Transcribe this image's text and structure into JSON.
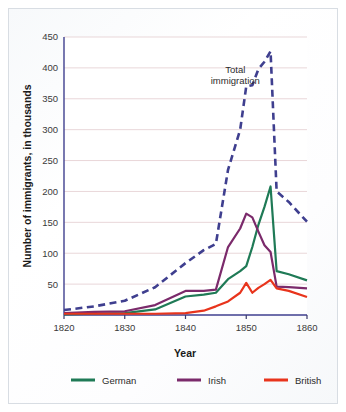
{
  "chart_data": {
    "type": "line",
    "title": "",
    "xlabel": "Year",
    "ylabel": "Number of immigrants, in thousands",
    "xlim": [
      1820,
      1860
    ],
    "ylim": [
      0,
      450
    ],
    "xticks": [
      1820,
      1830,
      1840,
      1850,
      1860
    ],
    "xtick_labels": [
      "1820",
      "1830",
      "1840",
      "1850",
      "1860"
    ],
    "yticks": [
      50,
      100,
      150,
      200,
      250,
      300,
      350,
      400,
      450
    ],
    "ytick_labels": [
      "50",
      "100",
      "150",
      "200",
      "250",
      "300",
      "350",
      "400",
      "450"
    ],
    "grid": "horizontal",
    "legend_position": "below",
    "annotations": [
      {
        "name": "total-immigration-label",
        "line1": "Total",
        "line2": "immigration",
        "x": 1848.2,
        "y": 392
      }
    ],
    "x": [
      1820,
      1825,
      1830,
      1835,
      1840,
      1843,
      1845,
      1847,
      1849,
      1850,
      1851,
      1852,
      1853,
      1854,
      1855,
      1857,
      1860
    ],
    "series": [
      {
        "name": "Total immigration",
        "key": "total",
        "color": "#3f3f8f",
        "style": "dashed",
        "in_legend": false,
        "values": [
          8,
          14,
          23,
          45,
          84,
          105,
          115,
          235,
          300,
          370,
          372,
          398,
          410,
          427,
          200,
          183,
          151
        ]
      },
      {
        "name": "German",
        "key": "german",
        "color": "#1f7a56",
        "style": "solid",
        "in_legend": true,
        "values": [
          1,
          2,
          3,
          9,
          30,
          33,
          36,
          58,
          71,
          79,
          110,
          146,
          175,
          208,
          71,
          66,
          56
        ]
      },
      {
        "name": "Irish",
        "key": "irish",
        "color": "#7b2a6b",
        "style": "solid",
        "in_legend": true,
        "values": [
          3,
          5,
          6,
          16,
          39,
          39,
          41,
          110,
          140,
          164,
          158,
          135,
          113,
          102,
          46,
          45,
          43
        ]
      },
      {
        "name": "British",
        "key": "british",
        "color": "#e8341c",
        "style": "solid",
        "in_legend": true,
        "values": [
          2,
          2,
          2,
          2,
          3,
          7,
          14,
          22,
          36,
          52,
          36,
          44,
          50,
          57,
          43,
          39,
          29
        ]
      }
    ],
    "legend": [
      {
        "label": "German",
        "color": "#1f7a56"
      },
      {
        "label": "Irish",
        "color": "#7b2a6b"
      },
      {
        "label": "British",
        "color": "#e8341c"
      }
    ],
    "colors": {
      "total_immigration": "#3f3f8f",
      "german": "#1f7a56",
      "irish": "#7b2a6b",
      "british": "#e8341c",
      "gridline": "#e9d7d9",
      "axis": "#3a3a6a",
      "card_border": "#d8dde3",
      "background": "#fdfdfd"
    }
  }
}
